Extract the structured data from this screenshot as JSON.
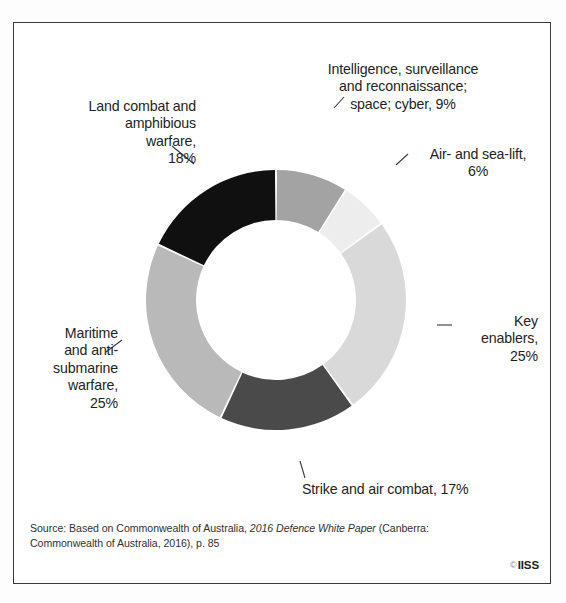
{
  "chart_data": {
    "type": "pie",
    "variant": "donut",
    "title": "",
    "subtitle": "",
    "xlabel": "",
    "ylabel": "",
    "legend_position": "callout-labels",
    "grid": false,
    "start_angle_deg": 0,
    "direction": "clockwise",
    "unit": "%",
    "categories": [
      "Intelligence, surveillance and reconnaissance; space; cyber",
      "Air- and sea-lift",
      "Key enablers",
      "Strike and air combat",
      "Maritime and anti-submarine warfare",
      "Land combat and amphibious warfare"
    ],
    "values": [
      9,
      6,
      25,
      17,
      25,
      18
    ],
    "colors": [
      "#a3a3a3",
      "#ededed",
      "#d9d9d9",
      "#4a4a4a",
      "#b9b9b9",
      "#101010"
    ],
    "slices": [
      {
        "name": "Intelligence, surveillance and reconnaissance; space; cyber",
        "value": 9,
        "label": "Intelligence, surveillance\nand reconnaissance;\nspace; cyber, 9%",
        "color": "#a3a3a3"
      },
      {
        "name": "Air- and sea-lift",
        "value": 6,
        "label": "Air- and sea-lift,\n6%",
        "color": "#ededed"
      },
      {
        "name": "Key enablers",
        "value": 25,
        "label": "Key\nenablers,\n25%",
        "color": "#d9d9d9"
      },
      {
        "name": "Strike and air combat",
        "value": 17,
        "label": "Strike and air combat, 17%",
        "color": "#4a4a4a"
      },
      {
        "name": "Maritime and anti-submarine warfare",
        "value": 25,
        "label": "Maritime\nand anti-\nsubmarine\nwarfare,\n25%",
        "color": "#b9b9b9"
      },
      {
        "name": "Land combat and amphibious warfare",
        "value": 18,
        "label": "Land combat and\namphibious\nwarfare,\n18%",
        "color": "#101010"
      }
    ]
  },
  "footer": {
    "source_prefix": "Source: Based on Commonwealth of Australia, ",
    "source_italic": "2016 Defence White Paper",
    "source_suffix": " (Canberra: Commonwealth of Australia, 2016), p. 85",
    "source_full": "Source: Based on Commonwealth of Australia, 2016 Defence White Paper (Canberra: Commonwealth of Australia, 2016), p. 85",
    "copyright_symbol": "©",
    "copyright_holder": "IISS"
  }
}
